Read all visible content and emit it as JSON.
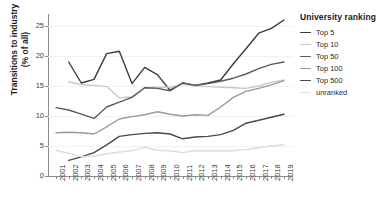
{
  "chart_data": {
    "type": "line",
    "title": "",
    "xlabel": "",
    "ylabel": "Transitions to industry\n(% of all)",
    "ylabel_line1": "Transitions to industry",
    "ylabel_line2": "(% of all)",
    "legend_title": "University ranking",
    "legend_position": "right",
    "grid": true,
    "ylim": [
      0,
      27
    ],
    "yticks": [
      0,
      5,
      10,
      15,
      20,
      25
    ],
    "x": [
      2001,
      2002,
      2003,
      2004,
      2005,
      2006,
      2007,
      2008,
      2009,
      2010,
      2011,
      2012,
      2013,
      2014,
      2015,
      2016,
      2017,
      2018,
      2019
    ],
    "categories": [
      "2001",
      "2002",
      "2003",
      "2004",
      "2005",
      "2006",
      "2007",
      "2008",
      "2009",
      "2010",
      "2011",
      "2012",
      "2013",
      "2014",
      "2015",
      "2016",
      "2017",
      "2018",
      "2019"
    ],
    "series": [
      {
        "name": "Top 5",
        "color": "#3c3c3c",
        "values": [
          null,
          19.0,
          15.5,
          16.1,
          20.4,
          20.8,
          15.4,
          18.1,
          16.9,
          14.3,
          15.5,
          15.1,
          15.5,
          16.0,
          18.7,
          21.2,
          23.8,
          24.6,
          26.0
        ]
      },
      {
        "name": "Top 10",
        "color": "#c8c8c8",
        "values": [
          null,
          15.7,
          15.2,
          15.1,
          14.9,
          13.0,
          13.2,
          14.7,
          14.8,
          14.8,
          15.3,
          15.0,
          14.9,
          14.8,
          14.7,
          14.6,
          15.0,
          15.6,
          16.0
        ]
      },
      {
        "name": "Top 50",
        "color": "#5a5a5a",
        "values": [
          11.4,
          11.0,
          10.3,
          9.6,
          11.5,
          12.3,
          13.1,
          14.7,
          14.6,
          14.2,
          15.5,
          15.1,
          15.4,
          15.8,
          16.3,
          17.0,
          17.9,
          18.6,
          19.0
        ]
      },
      {
        "name": "Top 100",
        "color": "#9a9a9a",
        "values": [
          7.2,
          7.3,
          7.2,
          7.0,
          8.2,
          9.5,
          9.9,
          10.2,
          10.7,
          10.3,
          10.0,
          10.2,
          10.1,
          11.5,
          13.1,
          14.1,
          14.6,
          15.2,
          15.9
        ]
      },
      {
        "name": "Top 500",
        "color": "#4a4a4a",
        "values": [
          null,
          2.6,
          3.2,
          3.9,
          5.2,
          6.6,
          6.9,
          7.1,
          7.2,
          7.0,
          6.2,
          6.5,
          6.6,
          6.9,
          7.6,
          8.8,
          9.3,
          9.8,
          10.3
        ]
      },
      {
        "name": "unranked",
        "color": "#dcdcdc",
        "values": [
          4.3,
          3.8,
          3.2,
          3.3,
          3.7,
          4.0,
          4.2,
          4.8,
          4.3,
          4.2,
          3.9,
          4.2,
          4.2,
          4.2,
          4.2,
          4.4,
          4.7,
          5.0,
          5.2
        ]
      }
    ]
  },
  "axis": {
    "tick_color": "#8a8a8a",
    "label_color": "#3d3d3d"
  }
}
